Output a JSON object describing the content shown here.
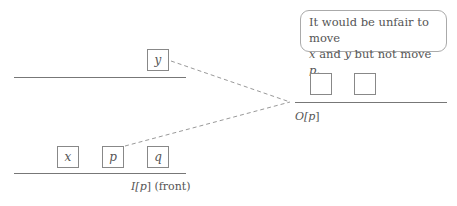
{
  "callout": {
    "line1": "It would be unfair to move",
    "line2_a": "x",
    "line2_b": " and ",
    "line2_c": "y",
    "line2_d": " but not move ",
    "line2_e": "p",
    "line2_f": "."
  },
  "top_queue": {
    "boxes": [
      "y"
    ]
  },
  "input_queue": {
    "boxes": [
      "x",
      "p",
      "q"
    ],
    "label_var": "I[",
    "label_p": "p",
    "label_end": "]",
    "label_suffix": "(front)"
  },
  "output_queue": {
    "boxes": [
      "",
      ""
    ],
    "label_var": "O[",
    "label_p": "p",
    "label_end": "]"
  },
  "colors": {
    "line": "#777777",
    "dash": "#999999",
    "text": "#555555"
  }
}
